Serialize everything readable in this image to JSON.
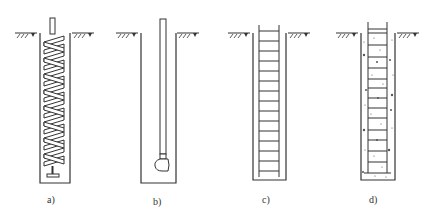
{
  "figure": {
    "panels": [
      {
        "id": "a",
        "label": "a)",
        "description": "Bored well with helical auger inserted"
      },
      {
        "id": "b",
        "label": "b)",
        "description": "Bored well with pipe and pump head at bottom"
      },
      {
        "id": "c",
        "label": "c)",
        "description": "Bored well with reinforcement cage (ladder)"
      },
      {
        "id": "d",
        "label": "d)",
        "description": "Well with cage and concrete fill"
      }
    ],
    "colors": {
      "line": "#333333",
      "background": "#ffffff"
    }
  }
}
